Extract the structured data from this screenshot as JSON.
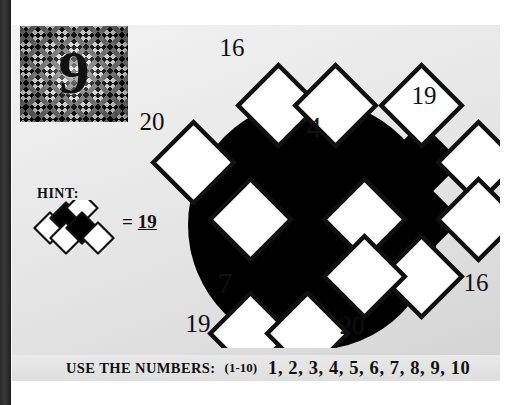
{
  "puzzle": {
    "number": "9",
    "badge_name": "puzzle-number-9"
  },
  "hint": {
    "label": "HINT:",
    "equals_sign": "=",
    "value": "19"
  },
  "footer": {
    "label": "USE THE NUMBERS:",
    "range": "(1-10)",
    "list": "1, 2, 3, 4, 5, 6, 7, 8, 9, 10"
  },
  "grid": {
    "clues": [
      {
        "name": "clue-top-left",
        "text": "16",
        "x": 79,
        "y": 14
      },
      {
        "name": "clue-upper-left",
        "text": "20",
        "x": 0,
        "y": 86
      },
      {
        "name": "clue-top-right",
        "text": "19",
        "x": 265,
        "y": 58
      },
      {
        "name": "clue-right",
        "text": "16",
        "x": 318,
        "y": 243
      },
      {
        "name": "clue-bottom-right",
        "text": "20",
        "x": 195,
        "y": 290
      },
      {
        "name": "clue-bottom-left",
        "text": "19",
        "x": 42,
        "y": 287
      }
    ],
    "given_cells": [
      {
        "name": "cell-given-4",
        "text": "4",
        "x": 174,
        "y": 102
      },
      {
        "name": "cell-given-7",
        "text": "7",
        "x": 85,
        "y": 258
      }
    ],
    "empty_cells_count": 10,
    "colors": {
      "ink": "#111111",
      "cell_fill": "#ffffff",
      "blocker_fill": "#000000",
      "circle_fill": "#000000",
      "paper": "#e8e8e8"
    }
  }
}
